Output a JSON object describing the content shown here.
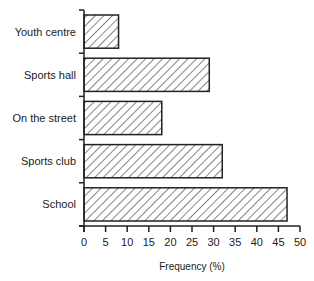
{
  "chart_data": {
    "type": "bar",
    "orientation": "horizontal",
    "title": "",
    "xlabel": "Frequency (%)",
    "ylabel": "",
    "categories": [
      "Youth centre",
      "Sports hall",
      "On the street",
      "Sports club",
      "School"
    ],
    "values": [
      8,
      29,
      18,
      32,
      47
    ],
    "xlim": [
      0,
      50
    ],
    "xticks": [
      0,
      5,
      10,
      15,
      20,
      25,
      30,
      35,
      40,
      45,
      50
    ],
    "grid": false,
    "legend": null,
    "bar_fill": "diagonal-hatch",
    "colors": {
      "stroke": "#222222",
      "fill": "#ffffff"
    }
  }
}
